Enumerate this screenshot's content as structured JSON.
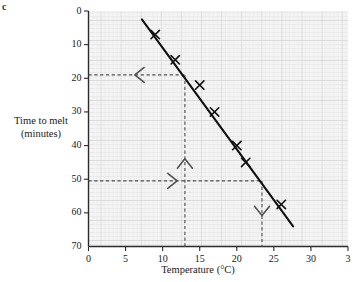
{
  "figure": {
    "corner_label": "c"
  },
  "axes": {
    "x_title": "Temperature (°C)",
    "y_title_line1": "Time to melt",
    "y_title_line2": "(minutes)",
    "x_ticks": [
      "0",
      "5",
      "10",
      "15",
      "20",
      "25",
      "30",
      "3"
    ],
    "y_ticks": [
      "70",
      "60",
      "50",
      "40",
      "30",
      "20",
      "10",
      "0"
    ]
  },
  "chart_data": {
    "type": "scatter",
    "title": "",
    "xlabel": "Temperature (°C)",
    "ylabel": "Time to melt (minutes)",
    "xlim": [
      0,
      35
    ],
    "ylim": [
      0,
      70
    ],
    "grid": true,
    "legend": "none",
    "x_tick_values": [
      0,
      5,
      10,
      15,
      20,
      25,
      30,
      35
    ],
    "y_tick_values": [
      0,
      10,
      20,
      30,
      40,
      50,
      60,
      70
    ],
    "points": [
      {
        "x": 9.0,
        "y": 63.0
      },
      {
        "x": 11.7,
        "y": 55.5
      },
      {
        "x": 15.0,
        "y": 48.0
      },
      {
        "x": 17.0,
        "y": 40.0
      },
      {
        "x": 20.0,
        "y": 30.0
      },
      {
        "x": 21.2,
        "y": 25.0
      },
      {
        "x": 26.0,
        "y": 12.5
      }
    ],
    "trend_line": {
      "name": "line of best fit",
      "x_start": 7.2,
      "y_start": 67.5,
      "x_end": 27.6,
      "y_end": 6.0
    },
    "construction_lines": [
      {
        "name": "read-off-at-13-degrees",
        "orientation": "vertical",
        "x": 13.0,
        "y_from": 0,
        "y_to": 51.0,
        "arrow": "up"
      },
      {
        "name": "read-off-to-51-minutes",
        "orientation": "horizontal",
        "y": 51.0,
        "x_from": 0,
        "x_to": 13.0,
        "arrow": "left"
      },
      {
        "name": "read-off-from-19-minutes",
        "orientation": "horizontal",
        "y": 19.5,
        "x_from": 0,
        "x_to": 23.4,
        "arrow": "right"
      },
      {
        "name": "read-off-at-23-degrees",
        "orientation": "vertical",
        "x": 23.4,
        "y_from": 19.5,
        "y_to": 0,
        "arrow": "down"
      }
    ]
  },
  "colors": {
    "axis": "#2b2b2b",
    "line": "#111111",
    "marker": "#111111",
    "dashed": "#4d4d4d",
    "grid_minor": "#dedede",
    "grid_major": "#cfcfcf",
    "plot_bg": "#f3f3f3"
  }
}
